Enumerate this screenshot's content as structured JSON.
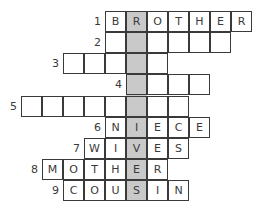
{
  "puzzle": {
    "cell_size": 21,
    "highlight_color": "#c9c9c9",
    "highlight_col_x": 127,
    "rows": [
      {
        "number": "1",
        "x": 106,
        "y": 12,
        "letters": [
          "B",
          "R",
          "O",
          "T",
          "H",
          "E",
          "R"
        ]
      },
      {
        "number": "2",
        "x": 106,
        "y": 33,
        "letters": [
          "",
          "",
          "",
          "",
          "",
          ""
        ]
      },
      {
        "number": "3",
        "x": 64,
        "y": 54,
        "letters": [
          "",
          "",
          "",
          "",
          ""
        ]
      },
      {
        "number": "4",
        "x": 127,
        "y": 75,
        "letters": [
          "",
          "",
          "",
          ""
        ]
      },
      {
        "number": "5",
        "x": 22,
        "y": 97,
        "letters": [
          "",
          "",
          "",
          "",
          "",
          "",
          "",
          ""
        ]
      },
      {
        "number": "6",
        "x": 106,
        "y": 118,
        "letters": [
          "N",
          "I",
          "E",
          "C",
          "E"
        ]
      },
      {
        "number": "7",
        "x": 85,
        "y": 139,
        "letters": [
          "W",
          "I",
          "V",
          "E",
          "S"
        ]
      },
      {
        "number": "8",
        "x": 43,
        "y": 160,
        "letters": [
          "M",
          "O",
          "T",
          "H",
          "E",
          "R"
        ]
      },
      {
        "number": "9",
        "x": 64,
        "y": 181,
        "letters": [
          "C",
          "O",
          "U",
          "S",
          "I",
          "N"
        ]
      }
    ]
  }
}
